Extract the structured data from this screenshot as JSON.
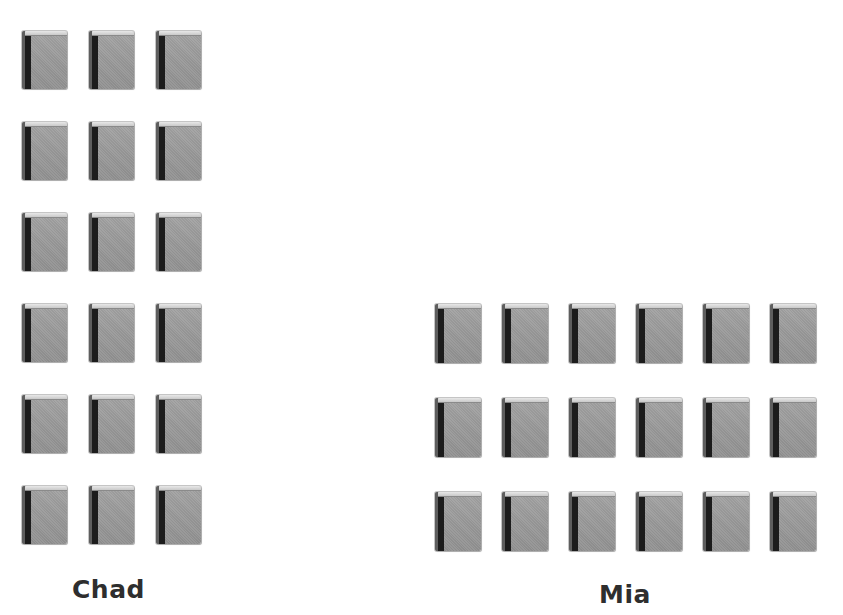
{
  "groups": [
    {
      "name": "Chad",
      "label": "Chad",
      "icon": "book-icon",
      "rows": 6,
      "columns": 3,
      "count": 18
    },
    {
      "name": "Mia",
      "label": "Mia",
      "icon": "book-icon",
      "rows": 3,
      "columns": 6,
      "count": 18
    }
  ],
  "colors": {
    "background": "#ffffff",
    "book_cover": "#9a9a9a",
    "book_spine": "#1c1c1c",
    "book_pages": "#e0e0e0",
    "label_text": "#2e2e2e"
  }
}
